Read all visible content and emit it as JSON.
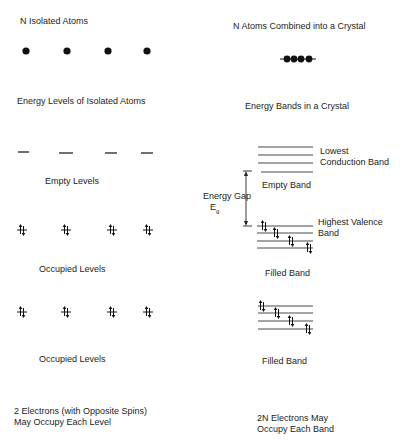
{
  "left": {
    "title": "N Isolated Atoms",
    "levels_heading": "Energy Levels of Isolated Atoms",
    "empty_label": "Empty Levels",
    "occupied_label_1": "Occupied Levels",
    "occupied_label_2": "Occupied Levels",
    "footer_line1": "2 Electrons (with Opposite Spins)",
    "footer_line2": "May Occupy Each Level"
  },
  "right": {
    "title": "N Atoms Combined into a Crystal",
    "bands_heading": "Energy Bands in a Crystal",
    "conduction_line1": "Lowest",
    "conduction_line2": "Conduction Band",
    "empty_band": "Empty Band",
    "gap_line1": "Energy Gap",
    "gap_symbol": "E",
    "gap_subscript": "g",
    "valence_line1": "Highest Valence",
    "valence_line2": "Band",
    "filled_band_1": "Filled Band",
    "filled_band_2": "Filled Band",
    "footer_line1": "2N Electrons May",
    "footer_line2": "Occupy Each Band"
  }
}
